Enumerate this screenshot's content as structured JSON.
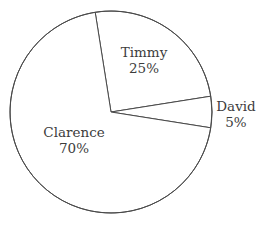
{
  "chart_data": {
    "type": "pie",
    "title": "",
    "categories": [
      "Timmy",
      "David",
      "Clarence"
    ],
    "values": [
      25,
      5,
      70
    ],
    "unit": "%",
    "legend": "none",
    "labels_position": "slice",
    "slices": [
      {
        "name": "Timmy",
        "value": 25,
        "value_label": "25%",
        "start_angle_deg": 99,
        "end_angle_deg": 9,
        "sweep_deg": 90,
        "placement": "inside"
      },
      {
        "name": "David",
        "value": 5,
        "value_label": "5%",
        "start_angle_deg": 9,
        "end_angle_deg": -9,
        "sweep_deg": 18,
        "placement": "outside"
      },
      {
        "name": "Clarence",
        "value": 70,
        "value_label": "70%",
        "start_angle_deg": -9,
        "end_angle_deg": -261,
        "sweep_deg": 252,
        "placement": "inside"
      }
    ],
    "geometry": {
      "center_x": 111,
      "center_y": 112,
      "radius": 101
    },
    "style": {
      "background": "#ffffff",
      "stroke": "#4a4a4a",
      "stroke_width": 1,
      "slice_fill": "#ffffff",
      "text_color": "#3c3c3c"
    }
  }
}
